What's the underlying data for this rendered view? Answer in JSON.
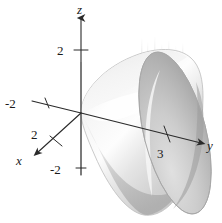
{
  "figure": {
    "name": "paraboloid-3d-plot",
    "background_color": "#ffffff",
    "width": 222,
    "height": 223
  },
  "axes": {
    "z": {
      "label": "z",
      "ticks": [
        {
          "label": "2",
          "value": 2
        },
        {
          "label": "-2",
          "value": -2
        }
      ]
    },
    "y": {
      "label": "y",
      "ticks": [
        {
          "label": "3",
          "value": 3
        }
      ]
    },
    "x": {
      "label": "x",
      "ticks": [
        {
          "label": "2",
          "value": 2
        }
      ]
    },
    "y_negative": {
      "ticks": [
        {
          "label": "-2",
          "value": -2
        }
      ]
    }
  },
  "surface": {
    "name": "paraboloid",
    "fill_light": "#f2f2f2",
    "fill_mid": "#d8d8d8",
    "fill_dark": "#a8a8a8",
    "outline_color": "#b4b4b4",
    "interior_fill": "#c8c8c8",
    "highlight": "#ffffff"
  },
  "colors": {
    "axis": "#2a2a2a",
    "text": "#1a1a1a",
    "grid_axis_hidden": "#b0b0b0"
  }
}
